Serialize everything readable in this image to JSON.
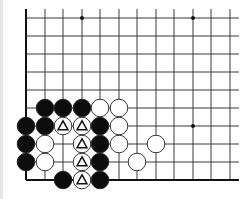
{
  "board": {
    "description": "Go problem diagram, lower-left corner",
    "colors": {
      "background": "#ffffff",
      "line": "#3a3a3a",
      "edge": "#111111",
      "black_stone": "#0d0d0d",
      "white_stone": "#ffffff",
      "stone_outline": "#222222",
      "marker": "#111111"
    },
    "grid": {
      "cols_x": [
        26,
        45,
        63,
        82,
        100,
        119,
        137,
        156,
        174,
        193,
        211,
        230
      ],
      "rows_y": [
        18,
        36,
        54,
        72,
        90,
        108,
        126,
        144,
        162,
        180
      ],
      "line_right_end": 239,
      "line_top_start": 9
    },
    "star_points": [
      {
        "col": 3,
        "row": 0
      },
      {
        "col": 9,
        "row": 0
      },
      {
        "col": 9,
        "row": 6
      }
    ],
    "stones": [
      {
        "color": "black",
        "col": 1,
        "row": 5
      },
      {
        "color": "black",
        "col": 2,
        "row": 5
      },
      {
        "color": "black",
        "col": 3,
        "row": 5
      },
      {
        "color": "white",
        "col": 4,
        "row": 5
      },
      {
        "color": "white",
        "col": 5,
        "row": 5
      },
      {
        "color": "black",
        "col": 0,
        "row": 6
      },
      {
        "color": "black",
        "col": 1,
        "row": 6
      },
      {
        "color": "white",
        "col": 2,
        "row": 6,
        "marker": "triangle"
      },
      {
        "color": "white",
        "col": 3,
        "row": 6,
        "marker": "triangle"
      },
      {
        "color": "black",
        "col": 4,
        "row": 6
      },
      {
        "color": "white",
        "col": 5,
        "row": 6
      },
      {
        "color": "black",
        "col": 0,
        "row": 7
      },
      {
        "color": "white",
        "col": 1,
        "row": 7
      },
      {
        "color": "white",
        "col": 3,
        "row": 7,
        "marker": "triangle"
      },
      {
        "color": "black",
        "col": 4,
        "row": 7
      },
      {
        "color": "white",
        "col": 5,
        "row": 7
      },
      {
        "color": "white",
        "col": 7,
        "row": 7
      },
      {
        "color": "black",
        "col": 0,
        "row": 8
      },
      {
        "color": "white",
        "col": 1,
        "row": 8
      },
      {
        "color": "white",
        "col": 3,
        "row": 8,
        "marker": "triangle"
      },
      {
        "color": "black",
        "col": 4,
        "row": 8
      },
      {
        "color": "white",
        "col": 6,
        "row": 8
      },
      {
        "color": "black",
        "col": 2,
        "row": 9
      },
      {
        "color": "white",
        "col": 3,
        "row": 9,
        "marker": "triangle"
      },
      {
        "color": "black",
        "col": 4,
        "row": 9
      }
    ]
  }
}
